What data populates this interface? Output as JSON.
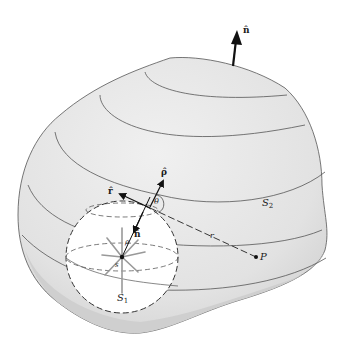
{
  "figure": {
    "labels": {
      "n_outer": "n̂",
      "n_inner": "n̂",
      "rho_hat": "ρ̂",
      "r_hat": "r̂",
      "theta": "θ",
      "rho": "ρ",
      "s_point": "s",
      "r": "r",
      "P": "P",
      "S1": "S",
      "S1_sub": "1",
      "S2": "S",
      "S2_sub": "2"
    },
    "colors": {
      "surface_fill": "#e6e6e6",
      "surface_shade": "#d2d2d2",
      "sphere_fill": "#ffffff",
      "line": "#444444",
      "arrow": "#111111",
      "star": "#9a9a9a"
    }
  }
}
